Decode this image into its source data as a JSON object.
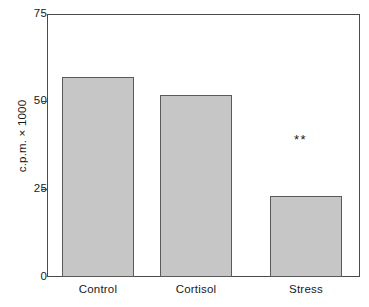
{
  "chart_data": {
    "type": "bar",
    "title": "",
    "subtitle": "",
    "xlabel": "",
    "ylabel": "c.p.m. × 1000",
    "categories": [
      "Control",
      "Cortisol",
      "Stress"
    ],
    "values": [
      57,
      52,
      23
    ],
    "series": [
      {
        "name": "c.p.m. × 1000",
        "values": [
          57,
          52,
          23
        ]
      }
    ],
    "ylim": [
      0,
      75
    ],
    "yticks": [
      0,
      25,
      50,
      75
    ],
    "ytick_labels": [
      "0",
      "25",
      "50",
      "75"
    ],
    "grid": false,
    "legend": false,
    "legend_position": "none",
    "bar_fill_color": "#c6c6c6",
    "bar_edge_color": "#5a5a5a",
    "axis_color": "#4a4a4a",
    "background_color": "#ffffff",
    "annotations": [
      {
        "text": "**",
        "category": "Stress",
        "value": 41,
        "meaning": "significance-marker"
      }
    ]
  }
}
